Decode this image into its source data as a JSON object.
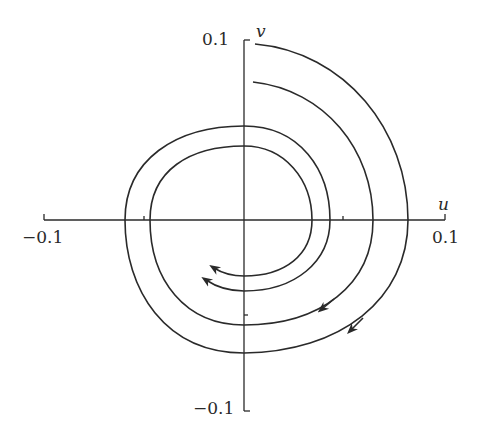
{
  "diagram": {
    "type": "phase-portrait",
    "axes": {
      "x_label": "u",
      "y_label": "v",
      "x_min_label": "−0.1",
      "x_max_label": "0.1",
      "y_max_label": "0.1",
      "y_min_label": "−0.1",
      "x_range": [
        -0.1,
        0.1
      ],
      "y_range": [
        -0.1,
        0.1
      ],
      "ticks": {
        "u": [
          -0.05,
          0.05
        ],
        "v": [
          -0.05
        ]
      }
    },
    "trajectories": [
      {
        "name": "outer-trajectory",
        "start": [
          0.005,
          0.098
        ],
        "direction": "clockwise",
        "arrows": 2
      },
      {
        "name": "inner-trajectory",
        "start": [
          0.003,
          0.077
        ],
        "direction": "clockwise",
        "arrows": 2
      }
    ],
    "colors": {
      "line": "#2a2a2a",
      "background": "#ffffff"
    }
  }
}
